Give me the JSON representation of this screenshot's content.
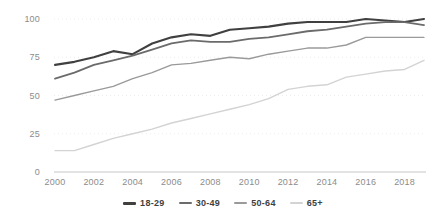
{
  "chart_data": {
    "type": "line",
    "title": "",
    "subtitle": "",
    "xlabel": "",
    "ylabel": "",
    "xlim": [
      2000,
      2019
    ],
    "ylim": [
      0,
      100
    ],
    "grid": true,
    "legend_position": "bottom",
    "x": [
      2000,
      2001,
      2002,
      2003,
      2004,
      2005,
      2006,
      2007,
      2008,
      2009,
      2010,
      2011,
      2012,
      2013,
      2014,
      2015,
      2016,
      2017,
      2018,
      2019
    ],
    "x_tick_labels": [
      "2000",
      "2002",
      "2004",
      "2006",
      "2008",
      "2010",
      "2012",
      "2014",
      "2016",
      "2018"
    ],
    "x_ticks": [
      2000,
      2002,
      2004,
      2006,
      2008,
      2010,
      2012,
      2014,
      2016,
      2018
    ],
    "y_ticks": [
      0,
      25,
      50,
      75,
      100
    ],
    "y_tick_labels": [
      "0",
      "25",
      "50",
      "75",
      "100"
    ],
    "series": [
      {
        "name": "18-29",
        "color": "#404040",
        "width": 2.1,
        "values": [
          70,
          72,
          75,
          79,
          77,
          84,
          88,
          90,
          89,
          93,
          94,
          95,
          97,
          98,
          98,
          98,
          100,
          99,
          98,
          100
        ]
      },
      {
        "name": "30-49",
        "color": "#6b6b6b",
        "width": 1.8,
        "values": [
          61,
          65,
          70,
          73,
          76,
          80,
          84,
          86,
          85,
          85,
          87,
          88,
          90,
          92,
          93,
          95,
          97,
          98,
          98,
          96
        ]
      },
      {
        "name": "50-64",
        "color": "#9a9a9a",
        "width": 1.4,
        "values": [
          47,
          50,
          53,
          56,
          61,
          65,
          70,
          71,
          73,
          75,
          74,
          77,
          79,
          81,
          81,
          83,
          88,
          88,
          88,
          88
        ]
      },
      {
        "name": "65+",
        "color": "#d3d3d3",
        "width": 1.4,
        "values": [
          14,
          14,
          18,
          22,
          25,
          28,
          32,
          35,
          38,
          41,
          44,
          48,
          54,
          56,
          57,
          62,
          64,
          66,
          67,
          73
        ]
      }
    ]
  },
  "legend": {
    "items": [
      {
        "label": "18-29",
        "color": "#404040"
      },
      {
        "label": "30-49",
        "color": "#6b6b6b"
      },
      {
        "label": "50-64",
        "color": "#9a9a9a"
      },
      {
        "label": "65+",
        "color": "#d3d3d3"
      }
    ]
  },
  "axes": {
    "y_axis_color": "#d9d9d9",
    "grid_color": "#ededed",
    "tick_text_color": "#8c8c8c"
  }
}
